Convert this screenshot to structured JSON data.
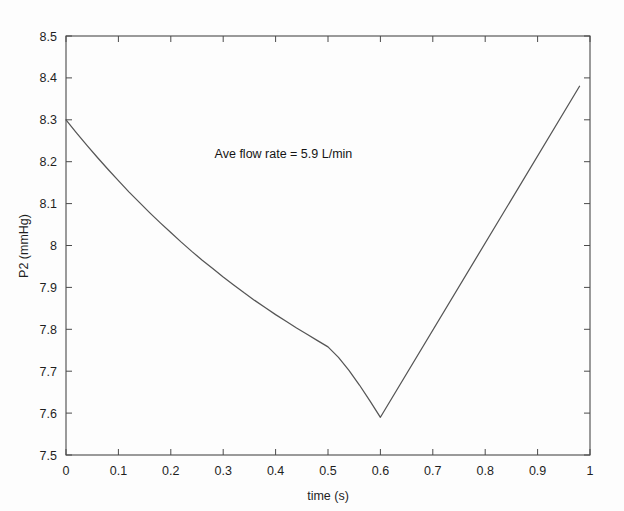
{
  "chart_data": {
    "type": "line",
    "title": "",
    "xlabel": "time (s)",
    "ylabel": "P2 (mmHg)",
    "xlim": [
      0,
      1
    ],
    "ylim": [
      7.5,
      8.5
    ],
    "grid": false,
    "legend": null,
    "line_color": "#555555",
    "background_color": "#ffffff",
    "xticks": [
      0,
      0.1,
      0.2,
      0.3,
      0.4,
      0.5,
      0.6,
      0.7,
      0.8,
      0.9,
      1
    ],
    "xtick_labels": [
      "0",
      "0.1",
      "0.2",
      "0.3",
      "0.4",
      "0.5",
      "0.6",
      "0.7",
      "0.8",
      "0.9",
      "1"
    ],
    "yticks": [
      7.5,
      7.6,
      7.7,
      7.8,
      7.9,
      8.0,
      8.1,
      8.2,
      8.3,
      8.4,
      8.5
    ],
    "ytick_labels": [
      "7.5",
      "7.6",
      "7.7",
      "7.8",
      "7.9",
      "8",
      "8.1",
      "8.2",
      "8.3",
      "8.4",
      "8.5"
    ],
    "annotations": [
      {
        "text": "Ave flow rate = 5.9 L/min",
        "x": 0.415,
        "y": 8.21
      }
    ],
    "series": [
      {
        "name": "P2",
        "x": [
          0.0,
          0.02,
          0.04,
          0.06,
          0.08,
          0.1,
          0.12,
          0.14,
          0.16,
          0.18,
          0.2,
          0.22,
          0.24,
          0.26,
          0.28,
          0.3,
          0.32,
          0.34,
          0.36,
          0.38,
          0.4,
          0.42,
          0.44,
          0.46,
          0.48,
          0.5,
          0.52,
          0.54,
          0.56,
          0.58,
          0.6,
          0.98
        ],
        "values": [
          8.3,
          8.269,
          8.239,
          8.21,
          8.182,
          8.155,
          8.128,
          8.103,
          8.078,
          8.054,
          8.031,
          8.008,
          7.986,
          7.965,
          7.945,
          7.925,
          7.906,
          7.887,
          7.869,
          7.852,
          7.835,
          7.819,
          7.803,
          7.788,
          7.773,
          7.758,
          7.733,
          7.702,
          7.667,
          7.629,
          7.59,
          8.38
        ]
      }
    ]
  },
  "axes": {
    "x_axis_name": "time-axis",
    "y_axis_name": "p2-axis"
  }
}
